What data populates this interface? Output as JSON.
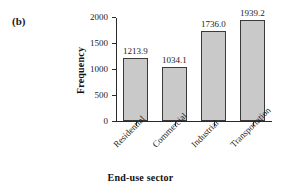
{
  "figure": {
    "panel_label": "(b)",
    "background_color": "#ffffff"
  },
  "chart_data": {
    "type": "bar",
    "title": "",
    "subtitle": "",
    "xlabel": "End-use sector",
    "ylabel": "Frequency",
    "categories": [
      "Residential",
      "Commercial",
      "Industrial",
      "Transportation"
    ],
    "values": [
      1213.9,
      1034.1,
      1736.0,
      1939.2
    ],
    "data_labels": [
      "1213.9",
      "1034.1",
      "1736.0",
      "1939.2"
    ],
    "ylim": [
      0,
      2000
    ],
    "yticks": [
      0,
      500,
      1000,
      1500,
      2000
    ],
    "ytick_labels": [
      "0",
      "500",
      "1000",
      "1500",
      "2000"
    ],
    "grid": false,
    "legend": null,
    "bar_fill_color": "#c9c9c9",
    "bar_edge_color": "#3a3a3a",
    "axis_color": "#2a2a2a",
    "category_label_rotation": -45
  }
}
